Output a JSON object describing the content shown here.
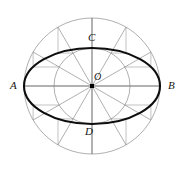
{
  "figure": {
    "type": "geometric-diagram",
    "canvas": {
      "width": 183,
      "height": 173
    },
    "center": {
      "name": "O",
      "x": 92,
      "y": 86
    },
    "outer_circle": {
      "radius": 68,
      "stroke": "#8c8c8c",
      "stroke_width": 0.7
    },
    "inner_circle": {
      "radius": 38,
      "stroke": "#8c8c8c",
      "stroke_width": 0.7
    },
    "ellipse": {
      "semi_major": 68,
      "semi_minor": 38,
      "stroke": "#0d0d0d",
      "stroke_width": 2.1,
      "fill": "none"
    },
    "radial_lines": {
      "count": 12,
      "angle_step_degrees": 30,
      "angles_degrees": [
        0,
        30,
        60,
        90,
        120,
        150,
        180,
        210,
        240,
        270,
        300,
        330
      ],
      "stroke": "#7a7a7a",
      "stroke_width": 0.6
    },
    "construction_lines": {
      "description": "vertical drops from outer-circle points and horizontal runs from inner-circle points meeting on the ellipse",
      "stroke": "#9a9a9a",
      "stroke_width": 0.6,
      "angles_degrees": [
        30,
        60,
        120,
        150,
        210,
        240,
        300,
        330
      ]
    },
    "axes": {
      "major": {
        "from": "A",
        "to": "B",
        "stroke": "#6e6e6e"
      },
      "minor": {
        "from": "C",
        "to": "D",
        "stroke": "#6e6e6e"
      }
    },
    "center_dot": {
      "size": 4,
      "color": "#000000"
    },
    "labels": {
      "A": "A",
      "B": "B",
      "C": "C",
      "D": "D",
      "O": "O"
    },
    "colors": {
      "background": "#ffffff",
      "ellipse": "#0d0d0d",
      "circles": "#8c8c8c",
      "rays": "#7a7a7a",
      "construction": "#9a9a9a",
      "label_text": "#151515"
    }
  }
}
